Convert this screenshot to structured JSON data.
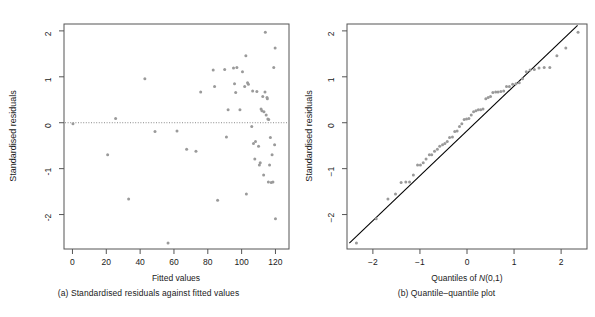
{
  "figure": {
    "background": "#ffffff",
    "point_color": "#9a9a9a",
    "line_color": "#000000",
    "axis_color": "#4d4d4d",
    "zero_line_color": "#808080"
  },
  "panels": [
    {
      "id": "panel-a",
      "caption": "(a) Standardised residuals against fitted values",
      "xlabel": "Fitted values",
      "ylabel": "Standardised residuals",
      "xticks": [
        0,
        20,
        40,
        60,
        80,
        100,
        120
      ],
      "yticks": [
        2,
        1,
        0,
        -1,
        -2
      ],
      "xtick_labels": [
        "0",
        "20",
        "40",
        "60",
        "80",
        "100",
        "120"
      ],
      "ytick_labels": [
        "2",
        "1",
        "0",
        "-1",
        "-2"
      ]
    },
    {
      "id": "panel-b",
      "caption": "(b) Quantile–quantile plot",
      "xlabel_prefix": "Quantiles of ",
      "xlabel_italic": "N",
      "xlabel_suffix": "(0,1)",
      "ylabel": "Standardised residuals",
      "xticks": [
        -2,
        -1,
        0,
        1,
        2
      ],
      "yticks": [
        2,
        1,
        0,
        -1,
        -2
      ],
      "xtick_labels": [
        "−2",
        "−1",
        "0",
        "1",
        "2"
      ],
      "ytick_labels": [
        "2",
        "1",
        "0",
        "−1",
        "−2"
      ]
    }
  ],
  "chart_data": [
    {
      "type": "scatter",
      "title": "(a) Standardised residuals against fitted values",
      "xlabel": "Fitted values",
      "ylabel": "Standardised residuals",
      "xlim": [
        -5,
        128
      ],
      "ylim": [
        -2.75,
        2.15
      ],
      "grid": false,
      "legend": "none",
      "annotations": [
        {
          "type": "hline",
          "y": 0,
          "style": "dotted",
          "label": "zero reference line"
        }
      ],
      "points": [
        [
          0.3,
          -0.02
        ],
        [
          20.8,
          -0.7
        ],
        [
          25.5,
          0.09
        ],
        [
          33.2,
          -1.66
        ],
        [
          42.8,
          0.96
        ],
        [
          48.8,
          -0.19
        ],
        [
          56.5,
          -2.62
        ],
        [
          61.8,
          -0.18
        ],
        [
          67.5,
          -0.58
        ],
        [
          73.0,
          -0.62
        ],
        [
          75.8,
          0.67
        ],
        [
          83.2,
          1.15
        ],
        [
          84.0,
          0.79
        ],
        [
          85.8,
          -1.69
        ],
        [
          90.0,
          1.16
        ],
        [
          91.0,
          -0.31
        ],
        [
          92.0,
          0.28
        ],
        [
          95.2,
          1.19
        ],
        [
          95.8,
          0.85
        ],
        [
          96.5,
          0.66
        ],
        [
          97.2,
          1.2
        ],
        [
          99.0,
          0.28
        ],
        [
          100.5,
          1.11
        ],
        [
          101.8,
          0.79
        ],
        [
          102.5,
          1.46
        ],
        [
          102.8,
          -1.55
        ],
        [
          103.5,
          0.87
        ],
        [
          104.0,
          0.84
        ],
        [
          106.0,
          -0.08
        ],
        [
          106.5,
          0.69
        ],
        [
          107.0,
          -0.45
        ],
        [
          107.8,
          -0.79
        ],
        [
          108.2,
          -0.41
        ],
        [
          109.0,
          0.68
        ],
        [
          110.0,
          -0.51
        ],
        [
          110.5,
          -0.92
        ],
        [
          111.0,
          -0.87
        ],
        [
          111.5,
          0.3
        ],
        [
          112.0,
          0.26
        ],
        [
          112.5,
          0.57
        ],
        [
          113.0,
          -1.14
        ],
        [
          113.2,
          0.24
        ],
        [
          113.8,
          0.67
        ],
        [
          114.0,
          1.97
        ],
        [
          114.5,
          0.17
        ],
        [
          115.0,
          0.55
        ],
        [
          115.2,
          0.52
        ],
        [
          115.5,
          0.08
        ],
        [
          115.8,
          -1.29
        ],
        [
          116.0,
          0.07
        ],
        [
          116.5,
          -0.92
        ],
        [
          117.0,
          -0.32
        ],
        [
          117.5,
          -1.3
        ],
        [
          118.0,
          -0.7
        ],
        [
          118.5,
          -1.29
        ],
        [
          119.0,
          1.2
        ],
        [
          119.5,
          -0.48
        ],
        [
          119.8,
          1.63
        ],
        [
          120.0,
          -2.09
        ]
      ]
    },
    {
      "type": "scatter",
      "title": "(b) Quantile–quantile plot",
      "xlabel": "Quantiles of N(0,1)",
      "ylabel": "Standardised residuals",
      "xlim": [
        -2.55,
        2.55
      ],
      "ylim": [
        -2.75,
        2.15
      ],
      "grid": false,
      "legend": "none",
      "annotations": [
        {
          "type": "line",
          "from": [
            -2.5,
            -2.62
          ],
          "to": [
            2.35,
            2.12
          ],
          "label": "reference line"
        }
      ],
      "points": [
        [
          -2.35,
          -2.62
        ],
        [
          -1.93,
          -2.09
        ],
        [
          -1.68,
          -1.66
        ],
        [
          -1.52,
          -1.55
        ],
        [
          -1.4,
          -1.3
        ],
        [
          -1.3,
          -1.29
        ],
        [
          -1.22,
          -1.29
        ],
        [
          -1.14,
          -1.14
        ],
        [
          -1.05,
          -0.92
        ],
        [
          -0.99,
          -0.92
        ],
        [
          -0.93,
          -0.87
        ],
        [
          -0.87,
          -0.79
        ],
        [
          -0.8,
          -0.7
        ],
        [
          -0.75,
          -0.7
        ],
        [
          -0.69,
          -0.62
        ],
        [
          -0.63,
          -0.58
        ],
        [
          -0.58,
          -0.51
        ],
        [
          -0.52,
          -0.48
        ],
        [
          -0.47,
          -0.45
        ],
        [
          -0.42,
          -0.41
        ],
        [
          -0.37,
          -0.32
        ],
        [
          -0.31,
          -0.31
        ],
        [
          -0.26,
          -0.19
        ],
        [
          -0.21,
          -0.18
        ],
        [
          -0.16,
          -0.08
        ],
        [
          -0.11,
          -0.02
        ],
        [
          -0.06,
          0.07
        ],
        [
          -0.01,
          0.08
        ],
        [
          0.04,
          0.09
        ],
        [
          0.09,
          0.17
        ],
        [
          0.14,
          0.24
        ],
        [
          0.19,
          0.26
        ],
        [
          0.24,
          0.28
        ],
        [
          0.29,
          0.28
        ],
        [
          0.34,
          0.3
        ],
        [
          0.4,
          0.52
        ],
        [
          0.45,
          0.55
        ],
        [
          0.5,
          0.57
        ],
        [
          0.55,
          0.66
        ],
        [
          0.61,
          0.67
        ],
        [
          0.66,
          0.67
        ],
        [
          0.72,
          0.68
        ],
        [
          0.78,
          0.69
        ],
        [
          0.84,
          0.79
        ],
        [
          0.9,
          0.79
        ],
        [
          0.97,
          0.84
        ],
        [
          1.04,
          0.85
        ],
        [
          1.11,
          0.87
        ],
        [
          1.18,
          0.96
        ],
        [
          1.26,
          1.11
        ],
        [
          1.34,
          1.15
        ],
        [
          1.43,
          1.16
        ],
        [
          1.53,
          1.19
        ],
        [
          1.64,
          1.2
        ],
        [
          1.76,
          1.2
        ],
        [
          1.91,
          1.46
        ],
        [
          2.1,
          1.63
        ],
        [
          2.36,
          1.97
        ]
      ]
    }
  ]
}
